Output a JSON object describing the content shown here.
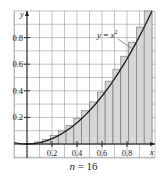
{
  "chart_data": {
    "type": "bar",
    "title": "",
    "function": "y = x^2",
    "annotation": "y = x²",
    "method": "right-endpoint Riemann sum",
    "n": 16,
    "interval": [
      0,
      1
    ],
    "xlabel": "x",
    "ylabel": "y",
    "xlim": [
      -0.1,
      1.03
    ],
    "ylim": [
      -0.1,
      1.0
    ],
    "grid": true,
    "x_ticks": [
      0.2,
      0.4,
      0.6,
      0.8
    ],
    "x_tick_labels": [
      "0.2",
      "0.4",
      "0.6",
      "0.8"
    ],
    "y_ticks": [
      0.2,
      0.4,
      0.6,
      0.8
    ],
    "y_tick_labels": [
      "0.2",
      "0.4",
      "0.6",
      "0.8"
    ],
    "categories": [
      "0.0625",
      "0.125",
      "0.1875",
      "0.25",
      "0.3125",
      "0.375",
      "0.4375",
      "0.5",
      "0.5625",
      "0.625",
      "0.6875",
      "0.75",
      "0.8125",
      "0.875",
      "0.9375",
      "1"
    ],
    "values": [
      0.0039,
      0.0156,
      0.0352,
      0.0625,
      0.0977,
      0.1406,
      0.1914,
      0.25,
      0.3164,
      0.3906,
      0.4727,
      0.5625,
      0.6602,
      0.7656,
      0.8789,
      1.0
    ]
  },
  "caption": {
    "var": "n",
    "text": " = 16"
  }
}
